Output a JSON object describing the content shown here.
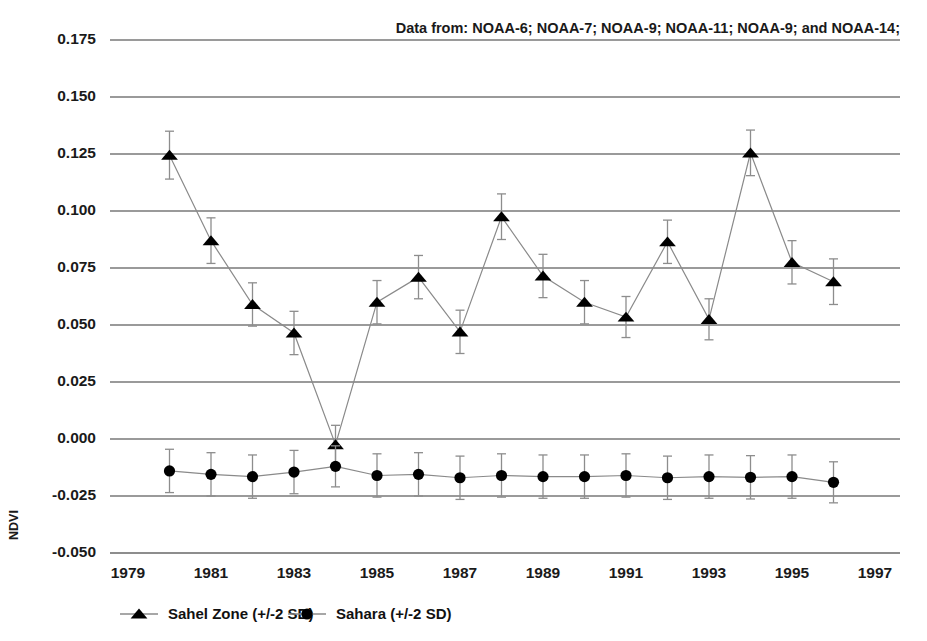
{
  "chart_data": {
    "type": "line",
    "title": "Data from: NOAA-6; NOAA-7; NOAA-9; NOAA-11; NOAA-9; and NOAA-14;",
    "xlabel": "",
    "ylabel": "NDVI",
    "xlim": [
      1979,
      1997
    ],
    "ylim": [
      -0.05,
      0.175
    ],
    "grid": true,
    "legend_position": "bottom-left",
    "x": [
      1980,
      1981,
      1982,
      1983,
      1984,
      1985,
      1986,
      1987,
      1988,
      1989,
      1990,
      1991,
      1992,
      1993,
      1994,
      1995,
      1996
    ],
    "xticks": [
      "1979",
      "1981",
      "1983",
      "1985",
      "1987",
      "1989",
      "1991",
      "1993",
      "1995",
      "1997"
    ],
    "xtick_values": [
      1979,
      1981,
      1983,
      1985,
      1987,
      1989,
      1991,
      1993,
      1995,
      1997
    ],
    "yticks": [
      "0.175",
      "0.150",
      "0.125",
      "0.100",
      "0.075",
      "0.050",
      "0.025",
      "0.000",
      "-0.025",
      "-0.050"
    ],
    "ytick_values": [
      0.175,
      0.15,
      0.125,
      0.1,
      0.075,
      0.05,
      0.025,
      0.0,
      -0.025,
      -0.05
    ],
    "series": [
      {
        "name": "Sahel Zone (+/-2 SD)",
        "marker": "triangle",
        "values": [
          0.1245,
          0.087,
          0.059,
          0.0465,
          -0.0025,
          0.06,
          0.071,
          0.047,
          0.0975,
          0.0715,
          0.06,
          0.0535,
          0.0865,
          0.0525,
          0.1255,
          0.0775,
          0.069
        ],
        "errors": [
          0.0105,
          0.01,
          0.0095,
          0.0095,
          0.0085,
          0.0095,
          0.0095,
          0.0095,
          0.01,
          0.0095,
          0.0095,
          0.009,
          0.0095,
          0.009,
          0.01,
          0.0095,
          0.01
        ]
      },
      {
        "name": "Sahara (+/-2 SD)",
        "marker": "circle",
        "values": [
          -0.014,
          -0.0155,
          -0.0165,
          -0.0145,
          -0.012,
          -0.016,
          -0.0155,
          -0.017,
          -0.016,
          -0.0165,
          -0.0165,
          -0.016,
          -0.017,
          -0.0165,
          -0.0168,
          -0.0165,
          -0.019
        ],
        "errors": [
          0.0095,
          0.0095,
          0.0095,
          0.0095,
          0.009,
          0.0095,
          0.0095,
          0.0095,
          0.0095,
          0.0095,
          0.0095,
          0.0095,
          0.0095,
          0.0095,
          0.0095,
          0.0095,
          0.009
        ]
      }
    ]
  },
  "legend": {
    "items": [
      {
        "label": "Sahel Zone (+/-2 SD)",
        "marker": "triangle"
      },
      {
        "label": "Sahara (+/-2 SD)",
        "marker": "circle"
      }
    ]
  }
}
